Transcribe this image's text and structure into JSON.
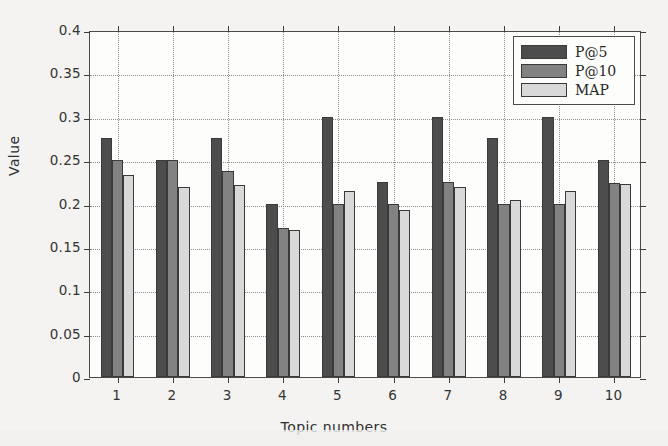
{
  "chart_data": {
    "type": "bar",
    "title": "",
    "xlabel": "Topic numbers",
    "ylabel": "Value",
    "categories": [
      "1",
      "2",
      "3",
      "4",
      "5",
      "6",
      "7",
      "8",
      "9",
      "10"
    ],
    "series": [
      {
        "name": "P@5",
        "color": "#4d4d4d",
        "values": [
          0.275,
          0.25,
          0.275,
          0.2,
          0.3,
          0.225,
          0.3,
          0.275,
          0.3,
          0.25
        ]
      },
      {
        "name": "P@10",
        "color": "#828282",
        "values": [
          0.25,
          0.25,
          0.238,
          0.172,
          0.2,
          0.2,
          0.225,
          0.2,
          0.2,
          0.224
        ]
      },
      {
        "name": "MAP",
        "color": "#d9d9d9",
        "values": [
          0.233,
          0.219,
          0.221,
          0.169,
          0.214,
          0.192,
          0.219,
          0.204,
          0.214,
          0.223
        ]
      }
    ],
    "ylim": [
      0,
      0.4
    ],
    "yticks": [
      "0",
      "0.05",
      "0.1",
      "0.15",
      "0.2",
      "0.25",
      "0.3",
      "0.35",
      "0.4"
    ],
    "ytick_values": [
      0,
      0.05,
      0.1,
      0.15,
      0.2,
      0.25,
      0.3,
      0.35,
      0.4
    ],
    "grid": true,
    "legend_position": "top-right"
  },
  "legend": {
    "entries": [
      {
        "label": "P@5"
      },
      {
        "label": "P@10"
      },
      {
        "label": "MAP"
      }
    ]
  },
  "axes": {
    "y_title": "Value",
    "x_title": "Topic numbers"
  }
}
